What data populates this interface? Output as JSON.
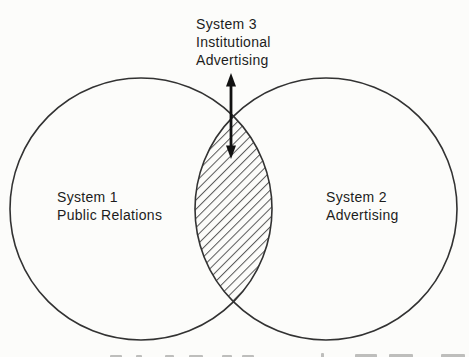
{
  "figure": {
    "type": "venn",
    "venn": {
      "sets": [
        {
          "id": "system-1",
          "label_lines": [
            "System 1",
            "Public Relations"
          ]
        },
        {
          "id": "system-2",
          "label_lines": [
            "System 2",
            "Advertising"
          ]
        }
      ],
      "intersection": {
        "id": "system-3",
        "label_lines": [
          "System 3",
          "Institutional",
          "Advertising"
        ],
        "fill_style": "diagonal-hatch",
        "pointer": "double-headed-arrow"
      }
    },
    "caption": {
      "note": "cropped at bottom edge; letter tops visible but illegible"
    },
    "colors": {
      "background": "#fcfcfa",
      "circle_stroke": "#323232",
      "hatch_line": "#585858",
      "arrow": "#111111",
      "text": "#1c1c1c"
    }
  }
}
